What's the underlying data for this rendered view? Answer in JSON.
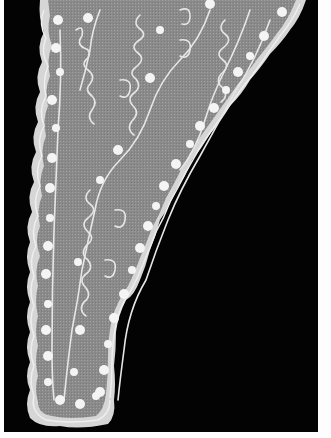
{
  "image": {
    "subject": "embroidered white lace lappet on black background",
    "description": "Tapering sheer muslin piece with scalloped border, white floral sprigs and scrolling vine embroidery",
    "colors": {
      "background": "#030303",
      "frame": "#fdfdfd",
      "fabric": "#8e8e8e",
      "embroidery": "#f2f2f2",
      "border": "#d8d8d8"
    }
  }
}
